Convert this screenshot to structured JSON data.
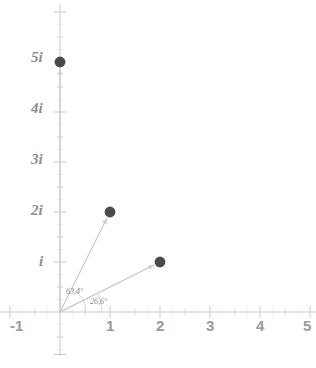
{
  "chart_data": {
    "type": "scatter",
    "title": "",
    "subtitle": "",
    "xlabel": "",
    "ylabel": "",
    "xlim": [
      -1.2,
      5.1
    ],
    "ylim": [
      -1.1,
      6.1
    ],
    "grid": false,
    "legend": null,
    "unit_px": 50,
    "origin_px": {
      "x": 60,
      "y": 312
    },
    "x_ticks": [
      {
        "value": -1,
        "label": "-1"
      },
      {
        "value": 1,
        "label": "1"
      },
      {
        "value": 2,
        "label": "2"
      },
      {
        "value": 3,
        "label": "3"
      },
      {
        "value": 4,
        "label": "4"
      },
      {
        "value": 5,
        "label": "5"
      }
    ],
    "y_ticks": [
      {
        "value": 1,
        "label": "i"
      },
      {
        "value": 2,
        "label": "2i"
      },
      {
        "value": 3,
        "label": "3i"
      },
      {
        "value": 4,
        "label": "4i"
      },
      {
        "value": 5,
        "label": "5i"
      }
    ],
    "points": [
      {
        "name": "point-1-plus-2i",
        "x": 1,
        "y": 2,
        "label": ""
      },
      {
        "name": "point-2-plus-i",
        "x": 2,
        "y": 1,
        "label": ""
      },
      {
        "name": "point-5i",
        "x": 0,
        "y": 5,
        "label": ""
      }
    ],
    "vectors": [
      {
        "name": "vector-1-plus-2i",
        "from": [
          0,
          0
        ],
        "to": [
          1,
          2
        ],
        "angle_deg": 63.4
      },
      {
        "name": "vector-2-plus-i",
        "from": [
          0,
          0
        ],
        "to": [
          2,
          1
        ],
        "angle_deg": 26.6
      },
      {
        "name": "vector-5i",
        "from": [
          0,
          0
        ],
        "to": [
          0,
          5
        ],
        "angle_deg": 90
      }
    ],
    "annotations": [
      {
        "name": "angle-label-63",
        "text": "63,4°",
        "x_px": 66,
        "y_px": 288
      },
      {
        "name": "angle-label-26",
        "text": "26,6°",
        "x_px": 90,
        "y_px": 298
      }
    ],
    "colors": {
      "point": "#4a4a4a",
      "vector": "#cfcfcf",
      "axis": "#c9c9c9",
      "tick_label_x": "#9a9a9a",
      "tick_label_y": "#8d8d8d",
      "annotation": "#8a8a8a",
      "background": "#ffffff"
    }
  }
}
